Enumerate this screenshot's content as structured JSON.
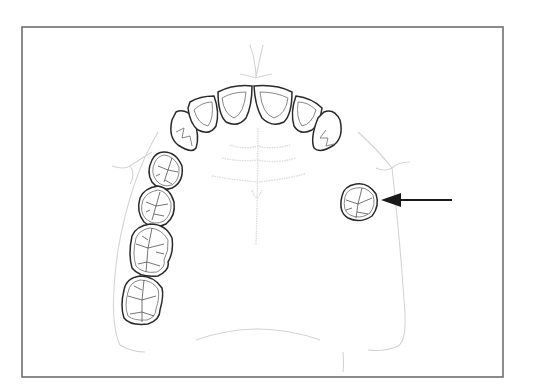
{
  "figure": {
    "type": "dental-diagram",
    "frame": {
      "x": 22,
      "y": 27,
      "width": 481,
      "height": 350,
      "stroke": "#6e6e6e"
    }
  },
  "arch": {
    "anterior_teeth": [
      {
        "id": "right-canine",
        "kind": "canine"
      },
      {
        "id": "right-lateral-incisor",
        "kind": "incisor"
      },
      {
        "id": "right-central-incisor",
        "kind": "incisor"
      },
      {
        "id": "left-central-incisor",
        "kind": "incisor"
      },
      {
        "id": "left-lateral-incisor",
        "kind": "incisor"
      },
      {
        "id": "left-canine",
        "kind": "canine"
      }
    ],
    "right_posterior_teeth": [
      {
        "id": "right-first-premolar",
        "kind": "premolar"
      },
      {
        "id": "right-second-premolar",
        "kind": "premolar"
      },
      {
        "id": "right-first-molar",
        "kind": "molar"
      },
      {
        "id": "right-second-molar",
        "kind": "molar"
      }
    ],
    "left_posterior_teeth": [
      {
        "id": "left-isolated-premolar",
        "kind": "premolar",
        "highlighted": true
      }
    ]
  },
  "annotation": {
    "arrow": {
      "direction": "left",
      "target": "left-isolated-premolar",
      "color": "#1a1a1a"
    }
  },
  "colors": {
    "tooth_outline": "#2a2a2a",
    "palate_outline": "#d4d4d4",
    "background": "#ffffff"
  }
}
